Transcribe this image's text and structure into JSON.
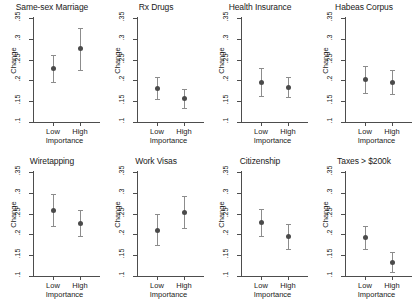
{
  "chart_data": {
    "type": "scatter",
    "title": "",
    "xlabel": "Importance",
    "ylabel": "Change",
    "categories": [
      "Low",
      "High"
    ],
    "ylim": [
      0.1,
      0.35
    ],
    "yticks": [
      ".1",
      ".15",
      ".2",
      ".25",
      ".3",
      ".35"
    ],
    "ytick_values": [
      0.1,
      0.15,
      0.2,
      0.25,
      0.3,
      0.35
    ],
    "grid": false,
    "legend": "none",
    "marker_color": "#4a4a4a",
    "whisker_color": "#8c8c8c",
    "axis_color": "#4d4d4d",
    "panels": [
      {
        "title": "Same-sex Marriage",
        "points": [
          {
            "category": "Low",
            "value": 0.23,
            "low": 0.197,
            "high": 0.262
          },
          {
            "category": "High",
            "value": 0.277,
            "low": 0.225,
            "high": 0.325
          }
        ]
      },
      {
        "title": "Rx Drugs",
        "points": [
          {
            "category": "Low",
            "value": 0.181,
            "low": 0.155,
            "high": 0.209
          },
          {
            "category": "High",
            "value": 0.157,
            "low": 0.134,
            "high": 0.18
          }
        ]
      },
      {
        "title": "Health Insurance",
        "points": [
          {
            "category": "Low",
            "value": 0.197,
            "low": 0.163,
            "high": 0.231
          },
          {
            "category": "High",
            "value": 0.184,
            "low": 0.161,
            "high": 0.209
          }
        ]
      },
      {
        "title": "Habeas Corpus",
        "points": [
          {
            "category": "Low",
            "value": 0.203,
            "low": 0.17,
            "high": 0.235
          },
          {
            "category": "High",
            "value": 0.196,
            "low": 0.168,
            "high": 0.225
          }
        ]
      },
      {
        "title": "Wiretapping",
        "points": [
          {
            "category": "Low",
            "value": 0.258,
            "low": 0.219,
            "high": 0.297
          },
          {
            "category": "High",
            "value": 0.228,
            "low": 0.197,
            "high": 0.259
          }
        ]
      },
      {
        "title": "Work Visas",
        "points": [
          {
            "category": "Low",
            "value": 0.211,
            "low": 0.175,
            "high": 0.248
          },
          {
            "category": "High",
            "value": 0.253,
            "low": 0.216,
            "high": 0.292
          }
        ]
      },
      {
        "title": "Citizenship",
        "points": [
          {
            "category": "Low",
            "value": 0.229,
            "low": 0.196,
            "high": 0.261
          },
          {
            "category": "High",
            "value": 0.195,
            "low": 0.165,
            "high": 0.224
          }
        ]
      },
      {
        "title": "Taxes > $200k",
        "points": [
          {
            "category": "Low",
            "value": 0.194,
            "low": 0.166,
            "high": 0.221
          },
          {
            "category": "High",
            "value": 0.133,
            "low": 0.11,
            "high": 0.157
          }
        ]
      }
    ]
  }
}
